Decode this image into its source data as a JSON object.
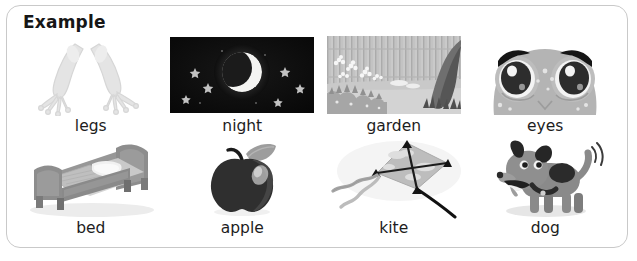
{
  "card": {
    "title": "Example",
    "border_color": "#c9c9c9",
    "background": "#ffffff"
  },
  "text_color": "#1d1d1d",
  "grid": {
    "columns": 4,
    "rows": 2,
    "items": [
      {
        "label": "legs",
        "icon": "frog-legs-illustration",
        "style": "line-drawing",
        "colors": {
          "fill": "#e2e2e2",
          "stroke": "#d2d2d2"
        }
      },
      {
        "label": "night",
        "icon": "night-sky-photo",
        "style": "photo",
        "colors": {
          "sky": "#111111",
          "moon": "#f2f2f2",
          "star": "#bdbdbd",
          "halo": "#3a3a3a"
        },
        "stars": 6
      },
      {
        "label": "garden",
        "icon": "garden-scene-photo",
        "style": "photo",
        "colors": {
          "fence": "#bdbdbd",
          "ground": "#c8c8c8",
          "tree": "#6e6e6e",
          "flowers": "#f5f5f5",
          "bush": "#a8a8a8"
        }
      },
      {
        "label": "eyes",
        "icon": "frog-eyes-illustration",
        "style": "cartoon",
        "colors": {
          "head": "#b6b6b6",
          "eye": "#2b2b2b",
          "brow": "#1a1a1a",
          "highlight": "#ffffff"
        }
      },
      {
        "label": "bed",
        "icon": "bed-illustration",
        "style": "isometric",
        "colors": {
          "frame": "#8f8f8f",
          "frame_dark": "#707070",
          "mattress": "#c4c4c4",
          "blanket": "#d9d9d9",
          "pillow": "#f0f0f0"
        }
      },
      {
        "label": "apple",
        "icon": "apple-illustration",
        "style": "flat",
        "colors": {
          "body": "#2e2e2e",
          "body_shade": "#4a4a4a",
          "leaf": "#9a9a9a",
          "stem": "#1a1a1a",
          "highlight": "#cfcfcf"
        }
      },
      {
        "label": "kite",
        "icon": "kite-illustration",
        "style": "flat",
        "colors": {
          "sail": "#b5b5b5",
          "sail_light": "#d6d6d6",
          "spar": "#1c1c1c",
          "string": "#111111",
          "tail": "#9e9e9e"
        }
      },
      {
        "label": "dog",
        "icon": "dog-illustration",
        "style": "cartoon",
        "colors": {
          "body": "#8a8a8a",
          "patch": "#2a2a2a",
          "ear": "#262626",
          "collar": "#2a2a2a",
          "shadow": "#e0e0e0",
          "motion": "#3a3a3a"
        }
      }
    ]
  }
}
